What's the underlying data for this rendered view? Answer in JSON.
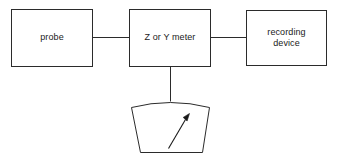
{
  "diagram": {
    "background_color": "#ffffff",
    "stroke_color": "#2b2b2b",
    "nodes": [
      {
        "id": "probe",
        "label": "probe",
        "shape": "rectangle"
      },
      {
        "id": "meter",
        "label": "Z or Y meter",
        "shape": "rectangle"
      },
      {
        "id": "recorder",
        "label": "recording\ndevice",
        "shape": "rectangle"
      },
      {
        "id": "analog-gauge",
        "label": "",
        "shape": "arched-trapezoid-meter-face"
      }
    ],
    "connectors": [
      {
        "id": "probe-to-meter",
        "from": "probe",
        "to": "meter",
        "orientation": "horizontal"
      },
      {
        "id": "meter-to-recorder",
        "from": "meter",
        "to": "recorder",
        "orientation": "horizontal"
      },
      {
        "id": "meter-to-gauge",
        "from": "meter",
        "to": "analog-gauge",
        "orientation": "vertical"
      }
    ],
    "gauge": {
      "needle": "arrow pointing up and to the right"
    }
  }
}
